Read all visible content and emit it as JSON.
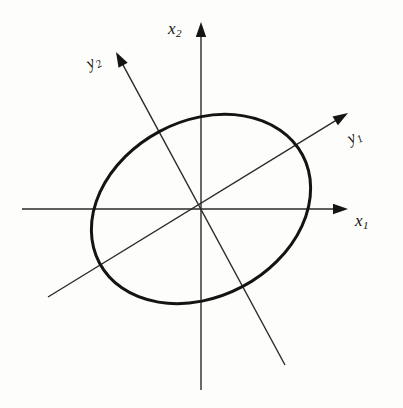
{
  "figure": {
    "kind": "rotated-ellipse-principal-axes-diagram",
    "background_color": "#fdfdfb",
    "ink_color": "#141414",
    "labels": {
      "x1": {
        "base": "x",
        "sub": "1"
      },
      "x2": {
        "base": "x",
        "sub": "2"
      },
      "y1": {
        "base": "y",
        "sub": "1"
      },
      "y2": {
        "base": "y",
        "sub": "2"
      }
    }
  },
  "chart_data": {
    "type": "scatter",
    "title": "",
    "xlabel": "x1",
    "ylabel": "x2",
    "grid": false,
    "legend": null,
    "annotations": [
      "x1",
      "x2",
      "y1",
      "y2"
    ],
    "origin_px": [
      201,
      209
    ],
    "ellipse": {
      "center_px": [
        201,
        209
      ],
      "semi_major_px": 115,
      "semi_minor_px": 88,
      "rotation_deg": -28,
      "stroke_width_px": 3,
      "extents_px": {
        "left": 96,
        "right": 305,
        "top": 114,
        "bottom": 302
      }
    },
    "axes": [
      {
        "name": "x1",
        "from_px": [
          22,
          209
        ],
        "to_px": [
          348,
          209
        ],
        "arrow": "end",
        "angle_deg": 0,
        "stroke_width_px": 1
      },
      {
        "name": "x2",
        "from_px": [
          201,
          390
        ],
        "to_px": [
          201,
          22
        ],
        "arrow": "end",
        "angle_deg": 90,
        "stroke_width_px": 1
      },
      {
        "name": "y1",
        "from_px": [
          48,
          297
        ],
        "to_px": [
          348,
          113
        ],
        "arrow": "end",
        "angle_deg": -28,
        "stroke_width_px": 1
      },
      {
        "name": "y2",
        "from_px": [
          285,
          365
        ],
        "to_px": [
          116,
          52
        ],
        "arrow": "end",
        "angle_deg": 62,
        "stroke_width_px": 1
      }
    ]
  }
}
